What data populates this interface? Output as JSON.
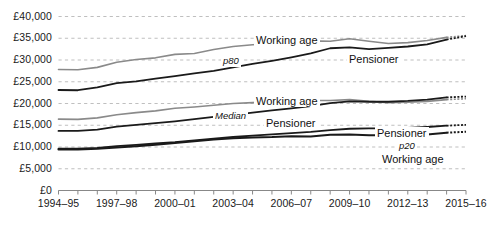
{
  "chart_data": {
    "type": "line",
    "title": "",
    "subtitle": "",
    "xlabel": "",
    "ylabel": "",
    "grid": true,
    "legend_position": "inline-annotations",
    "ylim": [
      0,
      40000
    ],
    "ytick_values": [
      0,
      5000,
      10000,
      15000,
      20000,
      25000,
      30000,
      35000,
      40000
    ],
    "ytick_labels": [
      "£0",
      "£5,000",
      "£10,000",
      "£15,000",
      "£20,000",
      "£25,000",
      "£30,000",
      "£35,000",
      "£40,000"
    ],
    "x": [
      "1994-95",
      "1995-96",
      "1996-97",
      "1997-98",
      "1998-99",
      "1999-00",
      "2000-01",
      "2001-02",
      "2002-03",
      "2003-04",
      "2004-05",
      "2005-06",
      "2006-07",
      "2007-08",
      "2008-09",
      "2009-10",
      "2010-11",
      "2011-12",
      "2012-13",
      "2013-14",
      "2014-15",
      "2015-16"
    ],
    "xtick_labels": [
      "1994–95",
      "1997–98",
      "2000–01",
      "2003–04",
      "2006–07",
      "2009–10",
      "2012–13",
      "2015–16"
    ],
    "xtick_indices": [
      0,
      3,
      6,
      9,
      12,
      15,
      18,
      21
    ],
    "series": [
      {
        "name": "Working age p80",
        "group": "p80",
        "population": "Working age",
        "color": "#8a8a8a",
        "width": 1.6,
        "dashed_from_index": 20,
        "values": [
          27800,
          27750,
          28300,
          29500,
          30100,
          30500,
          31300,
          31500,
          32400,
          33100,
          33500,
          33700,
          34100,
          34400,
          34300,
          34900,
          34300,
          33800,
          34000,
          34500,
          35200,
          35600
        ]
      },
      {
        "name": "Pensioner p80",
        "group": "p80",
        "population": "Pensioner",
        "color": "#1a1a1a",
        "width": 1.8,
        "dashed_from_index": 20,
        "values": [
          23100,
          23050,
          23700,
          24700,
          25100,
          25700,
          26300,
          26900,
          27500,
          28300,
          29100,
          29800,
          30600,
          31500,
          32700,
          32900,
          32500,
          32800,
          33100,
          33600,
          34700,
          35500
        ]
      },
      {
        "name": "Working age median",
        "group": "Median",
        "population": "Working age",
        "color": "#8a8a8a",
        "width": 1.6,
        "dashed_from_index": 20,
        "values": [
          16400,
          16350,
          16700,
          17400,
          17900,
          18300,
          18900,
          19200,
          19600,
          20000,
          20200,
          20400,
          20600,
          20700,
          20700,
          20900,
          20500,
          20200,
          20300,
          20500,
          20900,
          21100
        ]
      },
      {
        "name": "Pensioner median",
        "group": "Median",
        "population": "Pensioner",
        "color": "#1a1a1a",
        "width": 1.8,
        "dashed_from_index": 20,
        "values": [
          13700,
          13700,
          14000,
          14700,
          15100,
          15500,
          15900,
          16400,
          16900,
          17400,
          17900,
          18400,
          18900,
          19400,
          20100,
          20500,
          20400,
          20400,
          20600,
          20900,
          21400,
          21600
        ]
      },
      {
        "name": "Pensioner p20",
        "group": "p20",
        "population": "Pensioner",
        "color": "#1a1a1a",
        "width": 1.8,
        "dashed_from_index": 20,
        "values": [
          9600,
          9600,
          9800,
          10200,
          10500,
          10800,
          11100,
          11500,
          11900,
          12300,
          12600,
          12900,
          13200,
          13500,
          13900,
          14200,
          14300,
          14300,
          14400,
          14600,
          14900,
          15100
        ]
      },
      {
        "name": "Working age p20",
        "group": "p20",
        "population": "Working age",
        "color": "#1a1a1a",
        "width": 2.0,
        "dashed_from_index": 20,
        "values": [
          9400,
          9400,
          9600,
          9900,
          10200,
          10500,
          10900,
          11300,
          11700,
          12000,
          12200,
          12300,
          12500,
          12400,
          12800,
          12900,
          12700,
          12700,
          12800,
          12900,
          13300,
          13500
        ]
      }
    ],
    "annotations": [
      {
        "text": "Working age",
        "series": "Working age p80",
        "x_px": 254,
        "y_px": 34,
        "style": "plain"
      },
      {
        "text": "p80",
        "series": "p80-group",
        "x_px": 221,
        "y_px": 55,
        "style": "italic"
      },
      {
        "text": "Pensioner",
        "series": "Pensioner p80",
        "x_px": 347,
        "y_px": 53,
        "style": "plain"
      },
      {
        "text": "Working age",
        "series": "Working age median",
        "x_px": 254,
        "y_px": 95,
        "style": "plain"
      },
      {
        "text": "Median",
        "series": "median-group",
        "x_px": 213,
        "y_px": 110,
        "style": "italic"
      },
      {
        "text": "Pensioner",
        "series": "Pensioner median",
        "x_px": 264,
        "y_px": 117,
        "style": "plain"
      },
      {
        "text": "Pensioner",
        "series": "Pensioner p20",
        "x_px": 375,
        "y_px": 127,
        "style": "plain"
      },
      {
        "text": "p20",
        "series": "p20-group",
        "x_px": 397,
        "y_px": 140,
        "style": "italic"
      },
      {
        "text": "Working age",
        "series": "Working age p20",
        "x_px": 380,
        "y_px": 153,
        "style": "plain"
      }
    ],
    "colors": {
      "working_age": "#8a8a8a",
      "pensioner": "#1a1a1a",
      "gridline": "#b8b8b8",
      "axis": "#888888",
      "text": "#1a1a1a",
      "background": "#ffffff"
    }
  }
}
